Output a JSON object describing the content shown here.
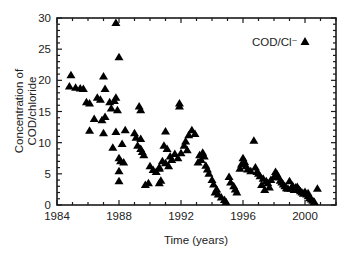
{
  "chart_data": {
    "type": "scatter",
    "title": "",
    "xlabel": "Time (years)",
    "ylabel_lines": [
      "Concentration of",
      "COD/chloride"
    ],
    "xlim": [
      1984,
      2002
    ],
    "ylim": [
      0,
      30
    ],
    "x_ticks": [
      1984,
      1988,
      1992,
      1996,
      2000
    ],
    "x_tick_labels": [
      "1984",
      "1988",
      "1992",
      "1996",
      "2000"
    ],
    "y_ticks": [
      0,
      5,
      10,
      15,
      20,
      25,
      30
    ],
    "y_tick_labels": [
      "0",
      "5",
      "10",
      "15",
      "20",
      "25",
      "30"
    ],
    "grid": false,
    "legend": {
      "position": "upper right",
      "entries": [
        {
          "label": "COD/Cl⁻",
          "marker": "triangle"
        }
      ]
    },
    "series": [
      {
        "name": "COD/Cl⁻",
        "marker": "triangle",
        "color": "#000000",
        "points": [
          [
            1984.9,
            20.8
          ],
          [
            1984.8,
            19.0
          ],
          [
            1985.2,
            18.8
          ],
          [
            1985.5,
            18.7
          ],
          [
            1985.7,
            18.6
          ],
          [
            1985.9,
            16.5
          ],
          [
            1986.1,
            16.3
          ],
          [
            1986.6,
            17.2
          ],
          [
            1986.8,
            16.9
          ],
          [
            1987.0,
            20.6
          ],
          [
            1987.1,
            18.6
          ],
          [
            1987.4,
            16.5
          ],
          [
            1987.8,
            17.2
          ],
          [
            1987.7,
            16.7
          ],
          [
            1987.5,
            15.5
          ],
          [
            1987.9,
            15.2
          ],
          [
            1986.4,
            13.8
          ],
          [
            1986.9,
            13.6
          ],
          [
            1987.1,
            14.1
          ],
          [
            1987.8,
            29.2
          ],
          [
            1988.0,
            23.7
          ],
          [
            1989.3,
            15.8
          ],
          [
            1989.4,
            15.2
          ],
          [
            1986.1,
            11.9
          ],
          [
            1987.0,
            11.5
          ],
          [
            1987.8,
            11.7
          ],
          [
            1988.4,
            12.0
          ],
          [
            1987.6,
            9.2
          ],
          [
            1988.2,
            9.8
          ],
          [
            1988.0,
            7.5
          ],
          [
            1988.1,
            7.0
          ],
          [
            1988.3,
            6.8
          ],
          [
            1988.0,
            5.4
          ],
          [
            1988.0,
            3.8
          ],
          [
            1989.0,
            11.5
          ],
          [
            1989.1,
            10.8
          ],
          [
            1989.4,
            10.6
          ],
          [
            1989.2,
            9.5
          ],
          [
            1989.4,
            9.0
          ],
          [
            1989.5,
            8.5
          ],
          [
            1989.6,
            8.0
          ],
          [
            1990.0,
            6.2
          ],
          [
            1990.2,
            5.6
          ],
          [
            1990.4,
            5.3
          ],
          [
            1990.6,
            5.8
          ],
          [
            1989.9,
            3.5
          ],
          [
            1989.7,
            3.2
          ],
          [
            1990.7,
            3.9
          ],
          [
            1990.6,
            3.5
          ],
          [
            1991.0,
            11.8
          ],
          [
            1990.9,
            9.5
          ],
          [
            1991.1,
            9.0
          ],
          [
            1991.3,
            7.8
          ],
          [
            1991.4,
            7.2
          ],
          [
            1990.8,
            7.0
          ],
          [
            1991.0,
            6.7
          ],
          [
            1991.2,
            6.2
          ],
          [
            1990.6,
            6.0
          ],
          [
            1991.6,
            8.2
          ],
          [
            1991.9,
            16.3
          ],
          [
            1991.9,
            15.8
          ],
          [
            1992.3,
            10.2
          ],
          [
            1992.5,
            11.2
          ],
          [
            1992.7,
            12.0
          ],
          [
            1992.9,
            11.4
          ],
          [
            1992.2,
            9.5
          ],
          [
            1992.4,
            8.8
          ],
          [
            1992.0,
            8.3
          ],
          [
            1991.8,
            7.5
          ],
          [
            1993.2,
            8.0
          ],
          [
            1993.3,
            7.2
          ],
          [
            1993.5,
            7.8
          ],
          [
            1993.4,
            8.4
          ],
          [
            1993.6,
            6.3
          ],
          [
            1993.7,
            5.7
          ],
          [
            1993.1,
            6.8
          ],
          [
            1993.8,
            5.0
          ],
          [
            1994.0,
            4.0
          ],
          [
            1994.1,
            3.3
          ],
          [
            1994.3,
            2.5
          ],
          [
            1994.4,
            1.7
          ],
          [
            1994.6,
            1.2
          ],
          [
            1994.8,
            0.8
          ],
          [
            1994.2,
            2.0
          ],
          [
            1994.9,
            0.5
          ],
          [
            1995.1,
            4.5
          ],
          [
            1995.2,
            3.6
          ],
          [
            1995.4,
            3.0
          ],
          [
            1995.5,
            2.5
          ],
          [
            1995.6,
            2.0
          ],
          [
            1995.8,
            5.8
          ],
          [
            1995.9,
            6.5
          ],
          [
            1996.0,
            7.5
          ],
          [
            1996.1,
            6.9
          ],
          [
            1996.2,
            6.2
          ],
          [
            1996.3,
            5.7
          ],
          [
            1996.5,
            5.4
          ],
          [
            1996.7,
            10.3
          ],
          [
            1996.8,
            6.0
          ],
          [
            1996.9,
            5.3
          ],
          [
            1997.0,
            5.0
          ],
          [
            1997.1,
            4.6
          ],
          [
            1997.3,
            4.2
          ],
          [
            1997.5,
            3.8
          ],
          [
            1997.6,
            3.5
          ],
          [
            1997.2,
            3.2
          ],
          [
            1997.7,
            2.8
          ],
          [
            1997.4,
            2.4
          ],
          [
            1997.8,
            4.0
          ],
          [
            1998.0,
            4.5
          ],
          [
            1998.1,
            5.3
          ],
          [
            1998.2,
            4.9
          ],
          [
            1998.3,
            4.4
          ],
          [
            1998.4,
            3.9
          ],
          [
            1998.5,
            3.6
          ],
          [
            1998.6,
            3.3
          ],
          [
            1998.7,
            3.0
          ],
          [
            1998.8,
            2.7
          ],
          [
            1999.0,
            3.8
          ],
          [
            1999.1,
            2.6
          ],
          [
            1999.3,
            2.4
          ],
          [
            1999.4,
            2.8
          ],
          [
            1999.5,
            2.9
          ],
          [
            1999.6,
            2.5
          ],
          [
            1999.7,
            2.2
          ],
          [
            1999.8,
            2.0
          ],
          [
            1999.9,
            1.8
          ],
          [
            2000.0,
            2.1
          ],
          [
            2000.1,
            1.7
          ],
          [
            2000.2,
            1.4
          ],
          [
            2000.3,
            1.1
          ],
          [
            2000.4,
            0.9
          ],
          [
            2000.5,
            0.7
          ],
          [
            2000.6,
            0.5
          ],
          [
            2000.8,
            2.6
          ],
          [
            2000.2,
            1.9
          ],
          [
            1999.2,
            3.1
          ],
          [
            1998.9,
            2.6
          ]
        ]
      }
    ]
  },
  "plot_area": {
    "left": 57,
    "top": 18,
    "right": 336,
    "bottom": 205
  },
  "colors": {
    "marker": "#000000",
    "axis": "#1a1a1a",
    "background": "#ffffff"
  }
}
